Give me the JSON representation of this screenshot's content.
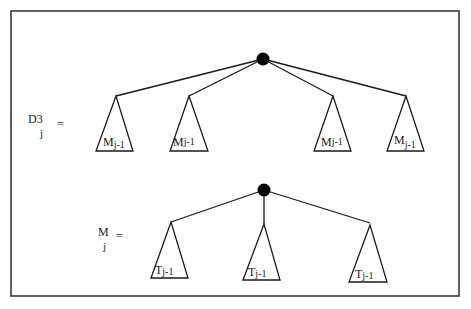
{
  "diagram": {
    "top": {
      "label_main": "D3",
      "label_sub": "j",
      "equals": "=",
      "children": [
        {
          "label_main": "M",
          "label_sub": "j-1"
        },
        {
          "label_main": "M",
          "label_sub": "j-1"
        },
        {
          "label_main": "M",
          "label_sub": "j-1"
        },
        {
          "label_main": "M",
          "label_sub": "j-1"
        }
      ]
    },
    "bottom": {
      "label_main": "M",
      "label_sub": "j",
      "equals": "=",
      "children": [
        {
          "label_main": "T",
          "label_sub": "j-1"
        },
        {
          "label_main": "T",
          "label_sub": "j-1"
        },
        {
          "label_main": "T",
          "label_sub": "j-1"
        }
      ]
    }
  }
}
